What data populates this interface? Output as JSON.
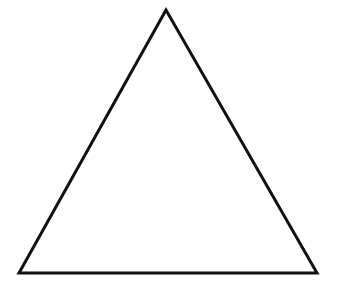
{
  "diagram": {
    "shape": "triangle",
    "style": "outline",
    "stroke_color": "#111111",
    "fill_color": "#ffffff",
    "stroke_width": 3,
    "vertices": {
      "apex": [
        166,
        10
      ],
      "bottom_left": [
        19,
        273
      ],
      "bottom_right": [
        317,
        273
      ]
    }
  }
}
